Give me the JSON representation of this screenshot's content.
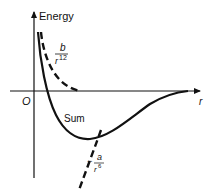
{
  "diagram": {
    "y_axis_label": "Energy",
    "x_axis_label": "r",
    "origin_label": "O",
    "curves": [
      {
        "id": "repulsive",
        "style": "dashed",
        "label_numerator": "b",
        "label_denominator_base": "r",
        "label_denominator_exp": "12"
      },
      {
        "id": "sum",
        "style": "solid",
        "label": "Sum"
      },
      {
        "id": "attractive",
        "style": "dashed",
        "label_sign": "−",
        "label_numerator": "a",
        "label_denominator_base": "r",
        "label_denominator_exp": "6"
      }
    ],
    "colors": {
      "ink": "#111111",
      "background": "#ffffff"
    }
  }
}
